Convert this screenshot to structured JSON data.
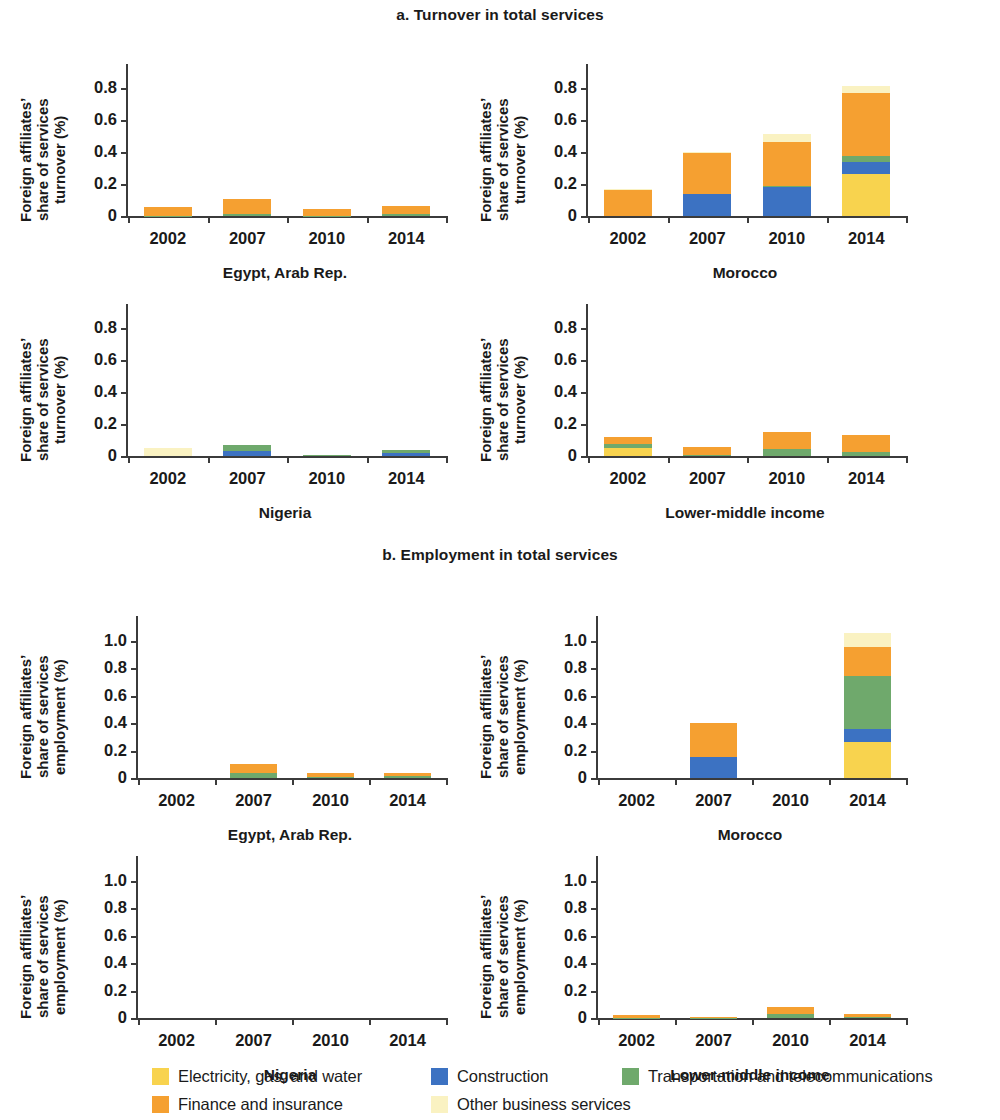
{
  "figure": {
    "panel_a_title": "a. Turnover in total services",
    "panel_b_title": "b. Employment in total services"
  },
  "legend": {
    "rows": [
      [
        {
          "label": "Electricity, gas, and water",
          "color": "#F8D34E",
          "key": "electricity"
        },
        {
          "label": "Construction",
          "color": "#3C72C2",
          "key": "construction"
        },
        {
          "label": "Transportation and telecommunications",
          "color": "#6FA96C",
          "key": "transportation"
        }
      ],
      [
        {
          "label": "Finance and insurance",
          "color": "#F5A031",
          "key": "finance"
        },
        {
          "label": "Other business services",
          "color": "#FAF2C2",
          "key": "other_business"
        }
      ]
    ]
  },
  "chart_data": [
    {
      "id": "turnover-egypt",
      "type": "bar",
      "stacked": true,
      "title": "Egypt, Arab Rep.",
      "xlabel": "",
      "ylabel": "Foreign affiliates’\nshare of services\nturnover (%)",
      "categories": [
        "2002",
        "2007",
        "2010",
        "2014"
      ],
      "ylim": [
        0,
        0.95
      ],
      "yticks": [
        0,
        0.2,
        0.4,
        0.6,
        0.8
      ],
      "ytick_labels": [
        "0",
        "0.2",
        "0.4",
        "0.6",
        "0.8"
      ],
      "grid": false,
      "series": [
        {
          "name": "Electricity, gas, and water",
          "color": "#F8D34E",
          "values": [
            0,
            0,
            0,
            0
          ]
        },
        {
          "name": "Construction",
          "color": "#3C72C2",
          "values": [
            0,
            0,
            0,
            0
          ]
        },
        {
          "name": "Transportation and telecommunications",
          "color": "#6FA96C",
          "values": [
            0.003,
            0.01,
            0.003,
            0.014
          ]
        },
        {
          "name": "Finance and insurance",
          "color": "#F5A031",
          "values": [
            0.054,
            0.096,
            0.04,
            0.05
          ]
        },
        {
          "name": "Other business services",
          "color": "#FAF2C2",
          "values": [
            0,
            0,
            0,
            0
          ]
        }
      ],
      "totals": [
        0.057,
        0.106,
        0.043,
        0.064
      ]
    },
    {
      "id": "turnover-morocco",
      "type": "bar",
      "stacked": true,
      "title": "Morocco",
      "xlabel": "",
      "ylabel": "Foreign affiliates’\nshare of services\nturnover (%)",
      "categories": [
        "2002",
        "2007",
        "2010",
        "2014"
      ],
      "ylim": [
        0,
        0.95
      ],
      "yticks": [
        0,
        0.2,
        0.4,
        0.6,
        0.8
      ],
      "ytick_labels": [
        "0",
        "0.2",
        "0.4",
        "0.6",
        "0.8"
      ],
      "grid": false,
      "series": [
        {
          "name": "Electricity, gas, and water",
          "color": "#F8D34E",
          "values": [
            0,
            0,
            0,
            0.265
          ]
        },
        {
          "name": "Construction",
          "color": "#3C72C2",
          "values": [
            0,
            0.135,
            0.18,
            0.07
          ]
        },
        {
          "name": "Transportation and telecommunications",
          "color": "#6FA96C",
          "values": [
            0,
            0,
            0.005,
            0.04
          ]
        },
        {
          "name": "Finance and insurance",
          "color": "#F5A031",
          "values": [
            0.165,
            0.26,
            0.28,
            0.395
          ]
        },
        {
          "name": "Other business services",
          "color": "#FAF2C2",
          "values": [
            0.003,
            0.005,
            0.05,
            0.04
          ]
        }
      ],
      "totals": [
        0.168,
        0.4,
        0.515,
        0.81
      ]
    },
    {
      "id": "turnover-nigeria",
      "type": "bar",
      "stacked": true,
      "title": "Nigeria",
      "xlabel": "",
      "ylabel": "Foreign affiliates’\nshare of services\nturnover (%)",
      "categories": [
        "2002",
        "2007",
        "2010",
        "2014"
      ],
      "ylim": [
        0,
        0.95
      ],
      "yticks": [
        0,
        0.2,
        0.4,
        0.6,
        0.8
      ],
      "ytick_labels": [
        "0",
        "0.2",
        "0.4",
        "0.6",
        "0.8"
      ],
      "grid": false,
      "series": [
        {
          "name": "Electricity, gas, and water",
          "color": "#F8D34E",
          "values": [
            0,
            0,
            0,
            0
          ]
        },
        {
          "name": "Construction",
          "color": "#3C72C2",
          "values": [
            0,
            0.03,
            0,
            0.018
          ]
        },
        {
          "name": "Transportation and telecommunications",
          "color": "#6FA96C",
          "values": [
            0,
            0.038,
            0.006,
            0.02
          ]
        },
        {
          "name": "Finance and insurance",
          "color": "#F5A031",
          "values": [
            0,
            0,
            0,
            0
          ]
        },
        {
          "name": "Other business services",
          "color": "#FAF2C2",
          "values": [
            0.052,
            0,
            0,
            0
          ]
        }
      ],
      "totals": [
        0.052,
        0.068,
        0.006,
        0.038
      ]
    },
    {
      "id": "turnover-lmi",
      "type": "bar",
      "stacked": true,
      "title": "Lower-middle income",
      "xlabel": "",
      "ylabel": "Foreign affiliates’\nshare of services\nturnover (%)",
      "categories": [
        "2002",
        "2007",
        "2010",
        "2014"
      ],
      "ylim": [
        0,
        0.95
      ],
      "yticks": [
        0,
        0.2,
        0.4,
        0.6,
        0.8
      ],
      "ytick_labels": [
        "0",
        "0.2",
        "0.4",
        "0.6",
        "0.8"
      ],
      "grid": false,
      "series": [
        {
          "name": "Electricity, gas, and water",
          "color": "#F8D34E",
          "values": [
            0.052,
            0,
            0,
            0
          ]
        },
        {
          "name": "Construction",
          "color": "#3C72C2",
          "values": [
            0,
            0,
            0,
            0
          ]
        },
        {
          "name": "Transportation and telecommunications",
          "color": "#6FA96C",
          "values": [
            0.022,
            0.004,
            0.042,
            0.028
          ]
        },
        {
          "name": "Finance and insurance",
          "color": "#F5A031",
          "values": [
            0.046,
            0.054,
            0.108,
            0.102
          ]
        },
        {
          "name": "Other business services",
          "color": "#FAF2C2",
          "values": [
            0,
            0,
            0,
            0
          ]
        }
      ],
      "totals": [
        0.12,
        0.058,
        0.15,
        0.13
      ]
    },
    {
      "id": "employment-egypt",
      "type": "bar",
      "stacked": true,
      "title": "Egypt, Arab Rep.",
      "xlabel": "",
      "ylabel": "Foreign affiliates’\nshare of services\nemployment (%)",
      "categories": [
        "2002",
        "2007",
        "2010",
        "2014"
      ],
      "ylim": [
        0,
        1.18
      ],
      "yticks": [
        0,
        0.2,
        0.4,
        0.6,
        0.8,
        1.0
      ],
      "ytick_labels": [
        "0",
        "0.2",
        "0.4",
        "0.6",
        "0.8",
        "1.0"
      ],
      "grid": false,
      "series": [
        {
          "name": "Electricity, gas, and water",
          "color": "#F8D34E",
          "values": [
            0,
            0,
            0,
            0
          ]
        },
        {
          "name": "Construction",
          "color": "#3C72C2",
          "values": [
            0,
            0,
            0,
            0
          ]
        },
        {
          "name": "Transportation and telecommunications",
          "color": "#6FA96C",
          "values": [
            0,
            0.038,
            0.006,
            0.012
          ]
        },
        {
          "name": "Finance and insurance",
          "color": "#F5A031",
          "values": [
            0,
            0.062,
            0.03,
            0.022
          ]
        },
        {
          "name": "Other business services",
          "color": "#FAF2C2",
          "values": [
            0,
            0,
            0,
            0
          ]
        }
      ],
      "totals": [
        0,
        0.1,
        0.036,
        0.034
      ]
    },
    {
      "id": "employment-morocco",
      "type": "bar",
      "stacked": true,
      "title": "Morocco",
      "xlabel": "",
      "ylabel": "Foreign affiliates’\nshare of services\nemployment (%)",
      "categories": [
        "2002",
        "2007",
        "2010",
        "2014"
      ],
      "ylim": [
        0,
        1.18
      ],
      "yticks": [
        0,
        0.2,
        0.4,
        0.6,
        0.8,
        1.0
      ],
      "ytick_labels": [
        "0",
        "0.2",
        "0.4",
        "0.6",
        "0.8",
        "1.0"
      ],
      "grid": false,
      "series": [
        {
          "name": "Electricity, gas, and water",
          "color": "#F8D34E",
          "values": [
            0,
            0,
            0,
            0.262
          ]
        },
        {
          "name": "Construction",
          "color": "#3C72C2",
          "values": [
            0,
            0.15,
            0,
            0.098
          ]
        },
        {
          "name": "Transportation and telecommunications",
          "color": "#6FA96C",
          "values": [
            0,
            0,
            0,
            0.38
          ]
        },
        {
          "name": "Finance and insurance",
          "color": "#F5A031",
          "values": [
            0,
            0.248,
            0,
            0.212
          ]
        },
        {
          "name": "Other business services",
          "color": "#FAF2C2",
          "values": [
            0,
            0,
            0,
            0.108
          ]
        }
      ],
      "totals": [
        0,
        0.398,
        0,
        1.06
      ]
    },
    {
      "id": "employment-nigeria",
      "type": "bar",
      "stacked": true,
      "title": "Nigeria",
      "xlabel": "",
      "ylabel": "Foreign affiliates’\nshare of services\nemployment (%)",
      "categories": [
        "2002",
        "2007",
        "2010",
        "2014"
      ],
      "ylim": [
        0,
        1.18
      ],
      "yticks": [
        0,
        0.2,
        0.4,
        0.6,
        0.8,
        1.0
      ],
      "ytick_labels": [
        "0",
        "0.2",
        "0.4",
        "0.6",
        "0.8",
        "1.0"
      ],
      "grid": false,
      "series": [
        {
          "name": "Electricity, gas, and water",
          "color": "#F8D34E",
          "values": [
            0,
            0,
            0,
            0
          ]
        },
        {
          "name": "Construction",
          "color": "#3C72C2",
          "values": [
            0,
            0,
            0,
            0
          ]
        },
        {
          "name": "Transportation and telecommunications",
          "color": "#6FA96C",
          "values": [
            0,
            0,
            0,
            0
          ]
        },
        {
          "name": "Finance and insurance",
          "color": "#F5A031",
          "values": [
            0,
            0,
            0,
            0
          ]
        },
        {
          "name": "Other business services",
          "color": "#FAF2C2",
          "values": [
            0,
            0,
            0,
            0
          ]
        }
      ],
      "totals": [
        0,
        0,
        0,
        0
      ]
    },
    {
      "id": "employment-lmi",
      "type": "bar",
      "stacked": true,
      "title": "Lower-middle income",
      "xlabel": "",
      "ylabel": "Foreign affiliates’\nshare of services\nemployment (%)",
      "categories": [
        "2002",
        "2007",
        "2010",
        "2014"
      ],
      "ylim": [
        0,
        1.18
      ],
      "yticks": [
        0,
        0.2,
        0.4,
        0.6,
        0.8,
        1.0
      ],
      "ytick_labels": [
        "0",
        "0.2",
        "0.4",
        "0.6",
        "0.8",
        "1.0"
      ],
      "grid": false,
      "series": [
        {
          "name": "Electricity, gas, and water",
          "color": "#F8D34E",
          "values": [
            0,
            0,
            0,
            0
          ]
        },
        {
          "name": "Construction",
          "color": "#3C72C2",
          "values": [
            0,
            0,
            0,
            0
          ]
        },
        {
          "name": "Transportation and telecommunications",
          "color": "#6FA96C",
          "values": [
            0.002,
            0.002,
            0.026,
            0.004
          ]
        },
        {
          "name": "Finance and insurance",
          "color": "#F5A031",
          "values": [
            0.018,
            0.006,
            0.056,
            0.028
          ]
        },
        {
          "name": "Other business services",
          "color": "#FAF2C2",
          "values": [
            0,
            0,
            0,
            0
          ]
        }
      ],
      "totals": [
        0.02,
        0.008,
        0.082,
        0.032
      ]
    }
  ],
  "layout": {
    "panels": [
      {
        "chart": 0,
        "left": 8,
        "top": 46,
        "plot_left": 118,
        "plot_top": 18,
        "plot_w": 318,
        "plot_h": 152,
        "ylabel_left": 10
      },
      {
        "chart": 1,
        "left": 468,
        "top": 46,
        "plot_left": 118,
        "plot_top": 18,
        "plot_w": 318,
        "plot_h": 152,
        "ylabel_left": 10
      },
      {
        "chart": 2,
        "left": 8,
        "top": 286,
        "plot_left": 118,
        "plot_top": 18,
        "plot_w": 318,
        "plot_h": 152,
        "ylabel_left": 10
      },
      {
        "chart": 3,
        "left": 468,
        "top": 286,
        "plot_left": 118,
        "plot_top": 18,
        "plot_w": 318,
        "plot_h": 152,
        "ylabel_left": 10
      },
      {
        "chart": 4,
        "left": 8,
        "top": 596,
        "plot_left": 128,
        "plot_top": 20,
        "plot_w": 308,
        "plot_h": 162,
        "ylabel_left": 10
      },
      {
        "chart": 5,
        "left": 468,
        "top": 596,
        "plot_left": 128,
        "plot_top": 20,
        "plot_w": 308,
        "plot_h": 162,
        "ylabel_left": 10
      },
      {
        "chart": 6,
        "left": 8,
        "top": 836,
        "plot_left": 128,
        "plot_top": 20,
        "plot_w": 308,
        "plot_h": 162,
        "ylabel_left": 10
      },
      {
        "chart": 7,
        "left": 468,
        "top": 836,
        "plot_left": 128,
        "plot_top": 20,
        "plot_w": 308,
        "plot_h": 162,
        "ylabel_left": 10
      }
    ]
  }
}
